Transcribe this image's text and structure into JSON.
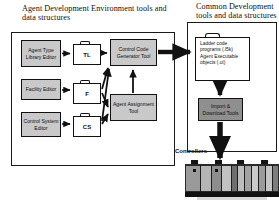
{
  "figure": {
    "type": "block-diagram"
  },
  "headers": {
    "left": "Agent Development Environment tools and data structures",
    "right": "Common Development tools and data structures"
  },
  "panels": {
    "ade_label": "Agent Development Environment",
    "common_label": "Common Development"
  },
  "editors": [
    {
      "id": "agent-type-library-editor",
      "label": "Agent Type Library Editor"
    },
    {
      "id": "facility-editor",
      "label": "Facility Editor"
    },
    {
      "id": "control-system-editor",
      "label": "Control System Editor"
    }
  ],
  "data_stores": [
    {
      "id": "tl",
      "label": "TL"
    },
    {
      "id": "f",
      "label": "F"
    },
    {
      "id": "cs",
      "label": "CS"
    }
  ],
  "tools": {
    "control_code_generator": "Control Code Generator Tool",
    "agent_assignment": "Agent Assignment Tool",
    "import_download": "Import & Download Tools"
  },
  "artifacts": {
    "line1": "Ladder code",
    "line2": "programs (.l5k)",
    "line3": "Agent Executable",
    "line4": "objects (.ul)"
  },
  "controllers": {
    "label": "Controllers"
  },
  "colors": {
    "node_fill": "#c9c9c9",
    "tool_fill": "#8f8f8f",
    "stroke": "#111111",
    "background": "#ffffff"
  }
}
